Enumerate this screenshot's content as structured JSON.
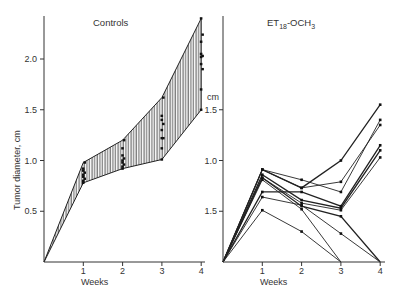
{
  "chart_data": [
    {
      "type": "area",
      "title": "Controls",
      "xlabel": "Weeks",
      "ylabel": "Tumor diameter, cm",
      "x": [
        0,
        1,
        2,
        3,
        4
      ],
      "xticks": [
        "1",
        "2",
        "3",
        "4"
      ],
      "yticks": [
        {
          "value": 0.5,
          "label": "0.5"
        },
        {
          "value": 1.0,
          "label": "1.0"
        },
        {
          "value": 1.5,
          "label": "1.5"
        },
        {
          "value": 2.0,
          "label": "2.0"
        }
      ],
      "ylim": [
        0,
        2.4
      ],
      "grid": false,
      "series": [
        {
          "name": "upper",
          "values": [
            0,
            0.98,
            1.2,
            1.62,
            2.4
          ]
        },
        {
          "name": "lower",
          "values": [
            0,
            0.78,
            0.92,
            1.01,
            1.5
          ]
        }
      ],
      "points": [
        {
          "x": 1,
          "values": [
            0.78,
            0.8,
            0.82,
            0.84,
            0.86,
            0.88,
            0.9,
            0.92,
            0.98
          ]
        },
        {
          "x": 2,
          "values": [
            0.92,
            0.94,
            0.96,
            0.98,
            1.0,
            1.02,
            1.05,
            1.12,
            1.2
          ]
        },
        {
          "x": 3,
          "values": [
            1.01,
            1.12,
            1.22,
            1.22,
            1.3,
            1.36,
            1.4,
            1.44,
            1.62
          ]
        },
        {
          "x": 4,
          "values": [
            1.5,
            1.7,
            1.9,
            1.95,
            2.02,
            2.03,
            2.05,
            2.17,
            2.24,
            2.4
          ]
        }
      ],
      "fill": "vertical-hatch"
    },
    {
      "type": "line",
      "title": "ET18-OCH3",
      "title_parts": {
        "base": "ET",
        "sub": "18",
        "mid": "-OCH",
        "sub2": "3"
      },
      "xlabel": "Weeks",
      "ylabel": "cm",
      "x": [
        0,
        1,
        2,
        3,
        4
      ],
      "xticks": [
        "1",
        "2",
        "3",
        "4"
      ],
      "yticks": [
        {
          "value": 0.5,
          "label": "1.5"
        },
        {
          "value": 1.0,
          "label": "1.0"
        },
        {
          "value": 1.5,
          "label": "1.5"
        }
      ],
      "ylim": [
        0,
        2.4
      ],
      "grid": false,
      "series": [
        {
          "name": "animal 1",
          "values": [
            0,
            0.91,
            0.73,
            1.0,
            1.55
          ]
        },
        {
          "name": "animal 2",
          "values": [
            0,
            0.91,
            0.81,
            0.69,
            1.4
          ]
        },
        {
          "name": "animal 3",
          "values": [
            0,
            0.91,
            0.73,
            0.79,
            1.35
          ]
        },
        {
          "name": "animal 4",
          "values": [
            0,
            0.86,
            0.61,
            0.53,
            1.1
          ]
        },
        {
          "name": "animal 5",
          "values": [
            0,
            0.83,
            0.58,
            0.51,
            1.03
          ]
        },
        {
          "name": "animal 6",
          "values": [
            0,
            0.81,
            0.52,
            0
          ]
        },
        {
          "name": "animal 7",
          "values": [
            0,
            0.69,
            0.69,
            0.55,
            1.15
          ]
        },
        {
          "name": "animal 8",
          "values": [
            0,
            0.64,
            0.56,
            0.28,
            0
          ]
        },
        {
          "name": "animal 9",
          "values": [
            0,
            0.51,
            0.3,
            0
          ]
        },
        {
          "name": "animal 10",
          "values": [
            0,
            0.83,
            0.55,
            0.45,
            0
          ]
        }
      ]
    }
  ],
  "labels": {
    "left_title": "Controls",
    "left_xlabel": "Weeks",
    "left_ylabel": "Tumor diameter, cm",
    "right_title_base": "ET",
    "right_title_sub": "18",
    "right_title_mid": "-OCH",
    "right_title_sub2": "3",
    "right_xlabel": "Weeks",
    "right_unit": "cm"
  }
}
